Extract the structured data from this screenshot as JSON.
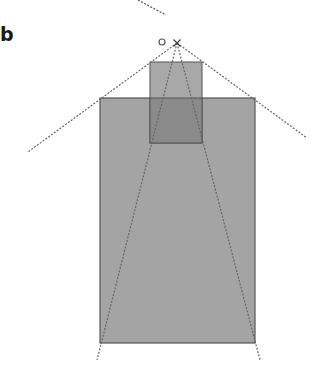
{
  "panel": {
    "label": "b"
  },
  "colors": {
    "background": "#ffffff",
    "large_rect_fill": "#a4a4a4",
    "small_rect_fill": "#a8a8a8",
    "overlap_fill": "#8a8a8a",
    "rect_stroke": "#555555",
    "dashed_line": "#666666"
  },
  "diagram": {
    "apex": {
      "x": 177,
      "y": 43,
      "marker": "cross"
    },
    "origin_marker": {
      "x": 162,
      "y": 42,
      "r": 3,
      "marker": "circle"
    },
    "large_rect": {
      "x": 100,
      "y": 98,
      "w": 155,
      "h": 245
    },
    "small_rect": {
      "x": 150,
      "y": 62,
      "w": 52,
      "h": 81
    },
    "overlap_rect": {
      "x": 150,
      "y": 98,
      "w": 52,
      "h": 45
    },
    "outer_lines": [
      {
        "x1": 177,
        "y1": 43,
        "x2": 28,
        "y2": 152
      },
      {
        "x1": 177,
        "y1": 43,
        "x2": 307,
        "y2": 138
      }
    ],
    "inner_lines": [
      {
        "x1": 177,
        "y1": 43,
        "x2": 97,
        "y2": 360
      },
      {
        "x1": 177,
        "y1": 43,
        "x2": 260,
        "y2": 360
      }
    ],
    "top_line": {
      "x1": 138,
      "y1": 0,
      "x2": 166,
      "y2": 15
    }
  }
}
